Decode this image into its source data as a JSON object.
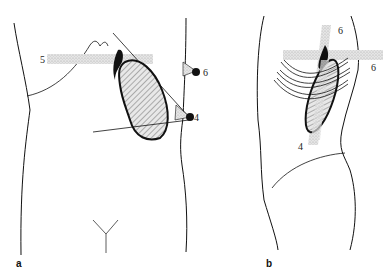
{
  "figure": {
    "panels": [
      {
        "id": "a",
        "label": "a",
        "view": "anterior",
        "markers": [
          {
            "label": "5"
          },
          {
            "label": "6"
          },
          {
            "label": "4"
          }
        ]
      },
      {
        "id": "b",
        "label": "b",
        "view": "lateral-oblique",
        "markers": [
          {
            "label": "6"
          },
          {
            "label": "6"
          },
          {
            "label": "4"
          }
        ]
      }
    ],
    "colors": {
      "line": "#111111",
      "stipple": "#cfcfcf",
      "hatch": "#777777",
      "background": "#ffffff"
    }
  }
}
